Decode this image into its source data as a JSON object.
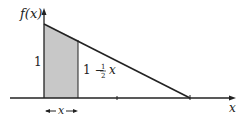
{
  "diagram": {
    "y_axis_label": "f(x)",
    "x_axis_label": "x",
    "height_label": "1",
    "line_label_prefix": "1 − ",
    "line_label_frac_num": "1",
    "line_label_frac_den": "2",
    "line_label_var": "x",
    "width_label": "x",
    "function": "f(x) = 1 - x/2",
    "domain": [
      0,
      2
    ],
    "shaded_region": "area under f from 0 to x",
    "colors": {
      "shade": "#c8c8c8",
      "line": "#222222"
    }
  }
}
